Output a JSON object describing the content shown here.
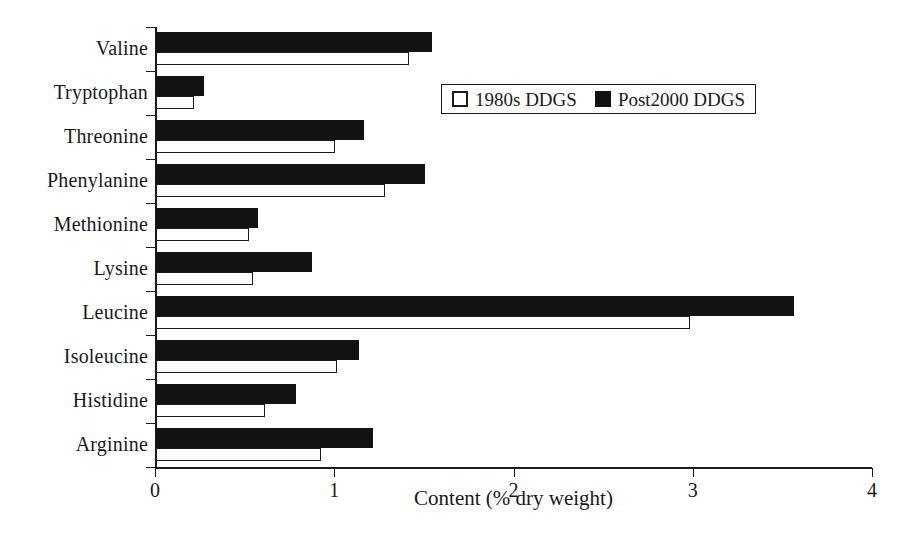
{
  "chart_data": {
    "type": "bar",
    "orientation": "horizontal",
    "title": "",
    "xlabel": "Content (% dry weight)",
    "ylabel": "",
    "xlim": [
      0,
      4
    ],
    "xticks": [
      "0",
      "1",
      "2",
      "3",
      "4"
    ],
    "grid": false,
    "legend_position": "upper-right-inside",
    "categories": [
      "Valine",
      "Tryptophan",
      "Threonine",
      "Phenylanine",
      "Methionine",
      "Lysine",
      "Leucine",
      "Isoleucine",
      "Histidine",
      "Arginine"
    ],
    "series": [
      {
        "name": "Post2000 DDGS",
        "color": "#121212",
        "style": "filled",
        "values": [
          1.54,
          0.27,
          1.16,
          1.5,
          0.57,
          0.87,
          3.56,
          1.13,
          0.78,
          1.21
        ]
      },
      {
        "name": "1980s DDGS",
        "color": "#ffffff",
        "style": "outlined",
        "values": [
          1.41,
          0.21,
          1.0,
          1.28,
          0.52,
          0.54,
          2.98,
          1.01,
          0.61,
          0.92
        ]
      }
    ]
  },
  "legend": {
    "entries": [
      {
        "label": "1980s DDGS",
        "swatch": "open-square-swatch"
      },
      {
        "label": "Post2000 DDGS",
        "swatch": "filled-square-swatch"
      }
    ]
  }
}
